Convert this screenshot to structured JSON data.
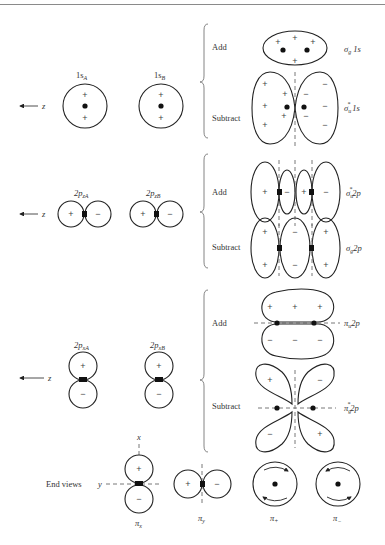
{
  "figure": {
    "type": "molecular orbital formation diagram",
    "axis_label": "z",
    "operations": {
      "add": "Add",
      "subtract": "Subtract"
    }
  },
  "rows": [
    {
      "id": "1s",
      "atomic_orbitals": [
        {
          "label": "1s",
          "sub": "A",
          "signs": [
            "+",
            "+"
          ]
        },
        {
          "label": "1s",
          "sub": "B",
          "signs": [
            "+",
            "+"
          ]
        }
      ],
      "combinations": [
        {
          "operation": "Add",
          "mo_label": "σ",
          "mo_sub": "g",
          "mo_sup": "",
          "mo_suffix": " 1s"
        },
        {
          "operation": "Subtract",
          "mo_label": "σ",
          "mo_sub": "u",
          "mo_sup": "*",
          "mo_suffix": " 1s"
        }
      ]
    },
    {
      "id": "2pz",
      "atomic_orbitals": [
        {
          "label": "2p",
          "sub": "zA",
          "signs": [
            "+",
            "−"
          ]
        },
        {
          "label": "2p",
          "sub": "zB",
          "signs": [
            "+",
            "−"
          ]
        }
      ],
      "combinations": [
        {
          "operation": "Add",
          "mo_label": "σ",
          "mo_sub": "u",
          "mo_sup": "*",
          "mo_suffix": "2p",
          "signs": [
            "+",
            "−",
            "+",
            "−"
          ]
        },
        {
          "operation": "Subtract",
          "mo_label": "σ",
          "mo_sub": "g",
          "mo_sup": "",
          "mo_suffix": "2p",
          "signs": [
            "+",
            "−",
            "+"
          ]
        }
      ]
    },
    {
      "id": "2px",
      "atomic_orbitals": [
        {
          "label": "2p",
          "sub": "xA",
          "signs": [
            "+",
            "−"
          ]
        },
        {
          "label": "2p",
          "sub": "xB",
          "signs": [
            "+",
            "−"
          ]
        }
      ],
      "combinations": [
        {
          "operation": "Add",
          "mo_label": "π",
          "mo_sub": "u",
          "mo_sup": "",
          "mo_suffix": "2p"
        },
        {
          "operation": "Subtract",
          "mo_label": "π",
          "mo_sub": "g",
          "mo_sup": "*",
          "mo_suffix": "2p"
        }
      ]
    }
  ],
  "end_views": {
    "label": "End views",
    "axis_x": "x",
    "axis_y": "y",
    "items": [
      {
        "label": "π",
        "sub": "x"
      },
      {
        "label": "π",
        "sub": "y"
      },
      {
        "label": "π",
        "sub": "+"
      },
      {
        "label": "π",
        "sub": "−"
      }
    ]
  },
  "signs": {
    "plus": "+",
    "minus": "−"
  }
}
